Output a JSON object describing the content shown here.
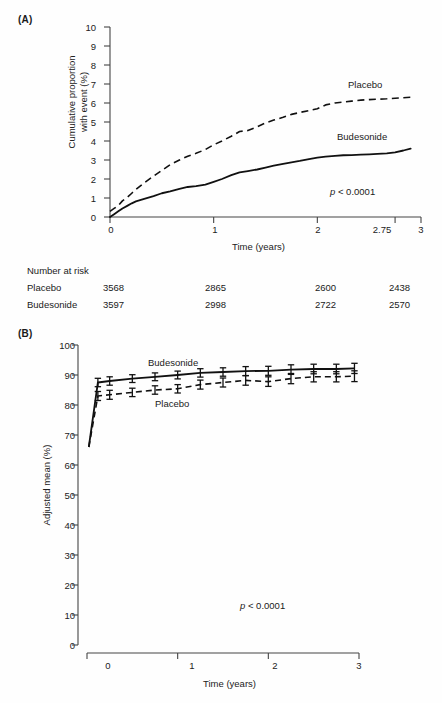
{
  "figure": {
    "panel_a_label": "(A)",
    "panel_b_label": "(B)",
    "risk_table_title": "Number at risk"
  },
  "panel_a": {
    "y_axis_title_line1": "Cumulative proportion",
    "y_axis_title_line2": "with event (%)",
    "x_axis_title": "Time (years)",
    "y_ticks": [
      "0",
      "1",
      "2",
      "3",
      "4",
      "5",
      "6",
      "7",
      "8",
      "9",
      "10"
    ],
    "x_ticks": [
      "0",
      "1",
      "2",
      "2.75",
      "3"
    ],
    "label_placebo": "Placebo",
    "label_budesonide": "Budesonide",
    "p_symbol": "p",
    "p_text": " < 0.0001"
  },
  "panel_b": {
    "y_axis_title": "Adjusted mean (%)",
    "x_axis_title": "Time (years)",
    "y_ticks": [
      "0",
      "10",
      "20",
      "30",
      "40",
      "50",
      "60",
      "70",
      "80",
      "90",
      "100"
    ],
    "x_ticks": [
      "0",
      "1",
      "2",
      "3"
    ],
    "label_placebo": "Placebo",
    "label_budesonide": "Budesonide",
    "p_symbol": "p",
    "p_text": " < 0.0001"
  },
  "risk_table": {
    "title": "Number at risk",
    "row_labels": [
      "Placebo",
      "Budesonide"
    ],
    "columns": [
      "0",
      "1",
      "2",
      "2.75"
    ],
    "rows": [
      {
        "name": "Placebo",
        "values": [
          "3568",
          "2865",
          "2600",
          "2438"
        ]
      },
      {
        "name": "Budesonide",
        "values": [
          "3597",
          "2998",
          "2722",
          "2570"
        ]
      }
    ]
  },
  "chart_data": [
    {
      "type": "line",
      "panel": "A",
      "title": "",
      "xlabel": "Time (years)",
      "ylabel": "Cumulative proportion with event (%)",
      "xlim": [
        0,
        3
      ],
      "ylim": [
        0,
        10
      ],
      "x_ticks": [
        0,
        1,
        2,
        2.75,
        3
      ],
      "y_ticks": [
        0,
        1,
        2,
        3,
        4,
        5,
        6,
        7,
        8,
        9,
        10
      ],
      "grid": false,
      "legend": "inline-annotations",
      "annotation": "p < 0.0001",
      "series": [
        {
          "name": "Placebo",
          "style": "dashed",
          "x": [
            0.0,
            0.04,
            0.08,
            0.12,
            0.17,
            0.21,
            0.25,
            0.33,
            0.42,
            0.5,
            0.58,
            0.67,
            0.75,
            0.83,
            0.92,
            1.0,
            1.08,
            1.17,
            1.25,
            1.33,
            1.42,
            1.5,
            1.58,
            1.67,
            1.75,
            1.83,
            1.92,
            2.0,
            2.08,
            2.17,
            2.25,
            2.33,
            2.42,
            2.5,
            2.58,
            2.67,
            2.75,
            2.83,
            2.9
          ],
          "y": [
            0.3,
            0.45,
            0.6,
            0.85,
            1.05,
            1.25,
            1.45,
            1.8,
            2.15,
            2.45,
            2.75,
            3.0,
            3.2,
            3.35,
            3.55,
            3.8,
            4.0,
            4.25,
            4.5,
            4.55,
            4.75,
            4.95,
            5.1,
            5.25,
            5.4,
            5.5,
            5.6,
            5.7,
            5.9,
            6.0,
            6.05,
            6.1,
            6.15,
            6.18,
            6.2,
            6.22,
            6.25,
            6.28,
            6.3
          ]
        },
        {
          "name": "Budesonide",
          "style": "solid",
          "x": [
            0.0,
            0.04,
            0.08,
            0.12,
            0.17,
            0.21,
            0.25,
            0.33,
            0.42,
            0.5,
            0.58,
            0.67,
            0.75,
            0.83,
            0.92,
            1.0,
            1.08,
            1.17,
            1.25,
            1.33,
            1.42,
            1.5,
            1.58,
            1.67,
            1.75,
            1.83,
            1.92,
            2.0,
            2.08,
            2.17,
            2.25,
            2.33,
            2.42,
            2.5,
            2.58,
            2.67,
            2.75,
            2.83,
            2.9
          ],
          "y": [
            0.0,
            0.15,
            0.3,
            0.45,
            0.6,
            0.72,
            0.82,
            0.95,
            1.1,
            1.25,
            1.35,
            1.48,
            1.58,
            1.62,
            1.7,
            1.85,
            2.0,
            2.2,
            2.35,
            2.42,
            2.5,
            2.6,
            2.7,
            2.8,
            2.88,
            2.95,
            3.05,
            3.12,
            3.18,
            3.22,
            3.25,
            3.26,
            3.28,
            3.3,
            3.32,
            3.35,
            3.4,
            3.5,
            3.6
          ]
        }
      ]
    },
    {
      "type": "line",
      "panel": "B",
      "title": "",
      "xlabel": "Time (years)",
      "ylabel": "Adjusted mean (%)",
      "xlim": [
        0,
        3
      ],
      "ylim": [
        0,
        100
      ],
      "x_ticks": [
        0,
        1,
        2,
        3
      ],
      "y_ticks": [
        0,
        10,
        20,
        30,
        40,
        50,
        60,
        70,
        80,
        90,
        100
      ],
      "grid": false,
      "legend": "inline-annotations",
      "annotation": "p < 0.0001",
      "error_bars": true,
      "series": [
        {
          "name": "Budesonide",
          "style": "solid",
          "x": [
            0.02,
            0.12,
            0.25,
            0.5,
            0.75,
            1.0,
            1.25,
            1.5,
            1.75,
            2.0,
            2.25,
            2.5,
            2.75,
            2.95
          ],
          "y": [
            66.0,
            87.5,
            88.0,
            88.8,
            89.4,
            90.0,
            90.7,
            91.0,
            91.3,
            91.4,
            91.8,
            92.0,
            92.0,
            92.2
          ],
          "yerr": [
            0,
            1.4,
            1.4,
            1.3,
            1.3,
            1.3,
            1.4,
            1.4,
            1.5,
            1.5,
            1.6,
            1.6,
            1.6,
            1.7
          ]
        },
        {
          "name": "Placebo",
          "style": "dashed",
          "x": [
            0.02,
            0.12,
            0.25,
            0.5,
            0.75,
            1.0,
            1.25,
            1.5,
            1.75,
            2.0,
            2.25,
            2.5,
            2.75,
            2.95
          ],
          "y": [
            66.0,
            83.0,
            83.4,
            84.2,
            85.0,
            85.4,
            86.8,
            87.5,
            88.2,
            87.8,
            88.8,
            89.4,
            89.4,
            89.6
          ],
          "yerr": [
            0,
            1.5,
            1.5,
            1.4,
            1.4,
            1.4,
            1.5,
            1.5,
            1.6,
            1.6,
            1.7,
            1.7,
            1.7,
            1.8
          ]
        }
      ]
    }
  ]
}
